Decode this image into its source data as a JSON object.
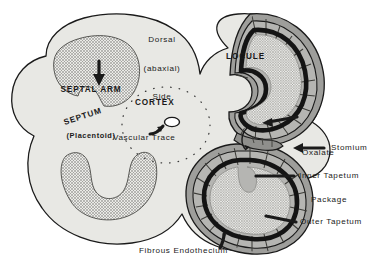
{
  "figure": {
    "orientation_note": {
      "line1": "Dorsal",
      "line2": "(abaxial)",
      "line3": "Side"
    },
    "colors": {
      "background": "#ffffff",
      "outline": "#1a1a1a",
      "septum_fill": "#e8e8e4",
      "septal_arm_fill": "#e2e2de",
      "endothecium_fill": "#b5b5b2",
      "outer_tapetum_fill": "#9e9e9b",
      "inner_tapetum_band": "#1a1a1a",
      "locule_fill": "#e6e6e3",
      "cortex_dots": "#3a3a3a",
      "vascular_trace_fill": "#ffffff",
      "label_text": "#1a1a1a"
    }
  },
  "labels": {
    "septal_arm": {
      "line1": "SEPTAL ARM",
      "line2": "(Placentoid)"
    },
    "septum": "SEPTUM",
    "cortex": "CORTEX",
    "vascular_trace": "Vascular Trace",
    "locule": "LOCULE",
    "oxalate_package": {
      "line1": "Oxalate",
      "line2": "Package"
    },
    "stomium": "Stomium",
    "inner_tapetum": "Inner Tapetum",
    "outer_tapetum": "Outer Tapetum",
    "fibrous_endothecium": "Fibrous Endothecium"
  },
  "structures": [
    {
      "name": "septum",
      "label": "SEPTUM",
      "region": "left-lobe-matrix"
    },
    {
      "name": "septal-arm-upper",
      "label": "SEPTAL ARM (Placentoid)",
      "region": "left-lobe-upper"
    },
    {
      "name": "septal-arm-lower",
      "label": "SEPTAL ARM (Placentoid)",
      "region": "left-lobe-lower"
    },
    {
      "name": "cortex",
      "label": "CORTEX",
      "region": "center"
    },
    {
      "name": "vascular-trace",
      "label": "Vascular Trace",
      "region": "center"
    },
    {
      "name": "locule-upper",
      "label": "LOCULE",
      "region": "right-lobe-upper"
    },
    {
      "name": "locule-lower",
      "label": "LOCULE",
      "region": "right-lobe-lower"
    },
    {
      "name": "inner-tapetum",
      "label": "Inner Tapetum",
      "region": "right-lobe"
    },
    {
      "name": "outer-tapetum",
      "label": "Outer Tapetum",
      "region": "right-lobe"
    },
    {
      "name": "fibrous-endothecium",
      "label": "Fibrous Endothecium",
      "region": "right-lobe-outer"
    },
    {
      "name": "oxalate-package",
      "label": "Oxalate Package",
      "region": "right-edge"
    },
    {
      "name": "stomium",
      "label": "Stomium",
      "region": "right-edge"
    }
  ]
}
